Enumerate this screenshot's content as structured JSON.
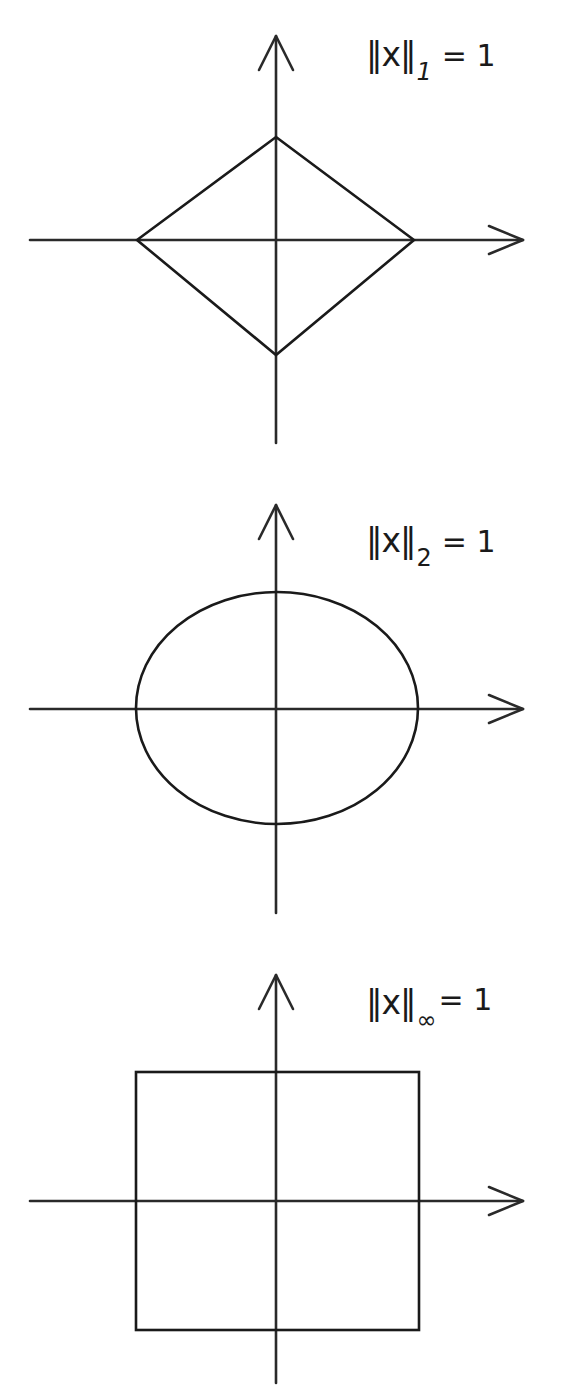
{
  "figure": {
    "panels": [
      {
        "id": "l1",
        "shape": "diamond",
        "label": {
          "norm": "‖x‖",
          "subscript": "1",
          "equals": "= 1"
        }
      },
      {
        "id": "l2",
        "shape": "circle",
        "label": {
          "norm": "‖x‖",
          "subscript": "2",
          "equals": "= 1"
        }
      },
      {
        "id": "linf",
        "shape": "square",
        "label": {
          "norm": "‖x‖",
          "subscript": "∞",
          "equals": "= 1"
        }
      }
    ],
    "colors": {
      "stroke": "#1a1a1a",
      "axis": "#2a2a2a",
      "background": "#ffffff"
    }
  }
}
